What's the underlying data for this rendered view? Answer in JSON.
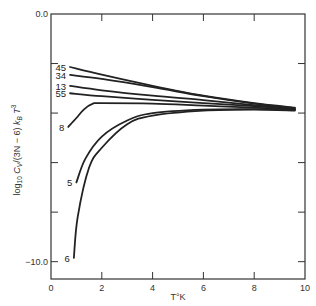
{
  "chart_data": {
    "type": "line",
    "title": "",
    "xlabel": "T°K",
    "ylabel": "log10 Cv/(3N − 6) kB T^3",
    "ylabel_parts": {
      "prefix": "log",
      "sub10": "10",
      "cv": "C",
      "cv_sub": "V",
      "mid": "/(3N − 6) ",
      "kb": "k",
      "kb_sub": "B",
      "t": " T",
      "t_sup": "3"
    },
    "xlim": [
      0,
      10
    ],
    "ylim": [
      -10.7,
      0.0
    ],
    "x_ticks": [
      0,
      2,
      4,
      6,
      8,
      10
    ],
    "x_tick_labels": [
      "0",
      "2",
      "4",
      "6",
      "8",
      "10"
    ],
    "y_ticks": [
      0,
      -2,
      -4,
      -6,
      -8,
      -10
    ],
    "y_tick_labels": {
      "0": "0.0",
      "-10": "−10.0"
    },
    "grid": false,
    "legend": "inline labels at left end of each curve",
    "series": [
      {
        "name": "45",
        "x": [
          0.75,
          2,
          4,
          6,
          8,
          9.6
        ],
        "values": [
          -2.14,
          -2.45,
          -2.9,
          -3.3,
          -3.6,
          -3.78
        ]
      },
      {
        "name": "34",
        "x": [
          0.75,
          2,
          4,
          6,
          8,
          9.6
        ],
        "values": [
          -2.46,
          -2.62,
          -2.95,
          -3.32,
          -3.62,
          -3.8
        ]
      },
      {
        "name": "13",
        "x": [
          0.75,
          2,
          4,
          6,
          8,
          9.6
        ],
        "values": [
          -2.9,
          -3.08,
          -3.3,
          -3.48,
          -3.68,
          -3.82
        ]
      },
      {
        "name": "55",
        "x": [
          0.75,
          2,
          4,
          6,
          8,
          9.6
        ],
        "values": [
          -3.2,
          -3.32,
          -3.47,
          -3.6,
          -3.72,
          -3.84
        ]
      },
      {
        "name": "8",
        "x": [
          0.68,
          1.0,
          1.3,
          1.65,
          2,
          4,
          6,
          8,
          9.6
        ],
        "values": [
          -4.56,
          -4.2,
          -3.85,
          -3.62,
          -3.6,
          -3.62,
          -3.7,
          -3.78,
          -3.86
        ]
      },
      {
        "name": "5",
        "x": [
          1.0,
          1.35,
          2,
          3,
          4,
          6,
          8,
          9.6
        ],
        "values": [
          -6.8,
          -5.85,
          -4.95,
          -4.3,
          -4.0,
          -3.86,
          -3.84,
          -3.88
        ]
      },
      {
        "name": "6",
        "x": [
          0.9,
          1.05,
          1.5,
          2,
          3,
          4,
          6,
          8,
          9.6
        ],
        "values": [
          -9.85,
          -8.2,
          -6.2,
          -5.4,
          -4.45,
          -4.1,
          -3.9,
          -3.86,
          -3.9
        ]
      }
    ]
  }
}
